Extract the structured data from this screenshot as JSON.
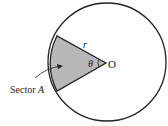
{
  "diagram": {
    "labels": {
      "radius": "r",
      "angle": "θ",
      "center": "O",
      "sector_prefix": "Sector ",
      "sector_name": "A"
    },
    "colors": {
      "sector_fill": "#b8b8b8",
      "stroke": "#222222",
      "background": "#ffffff"
    }
  }
}
